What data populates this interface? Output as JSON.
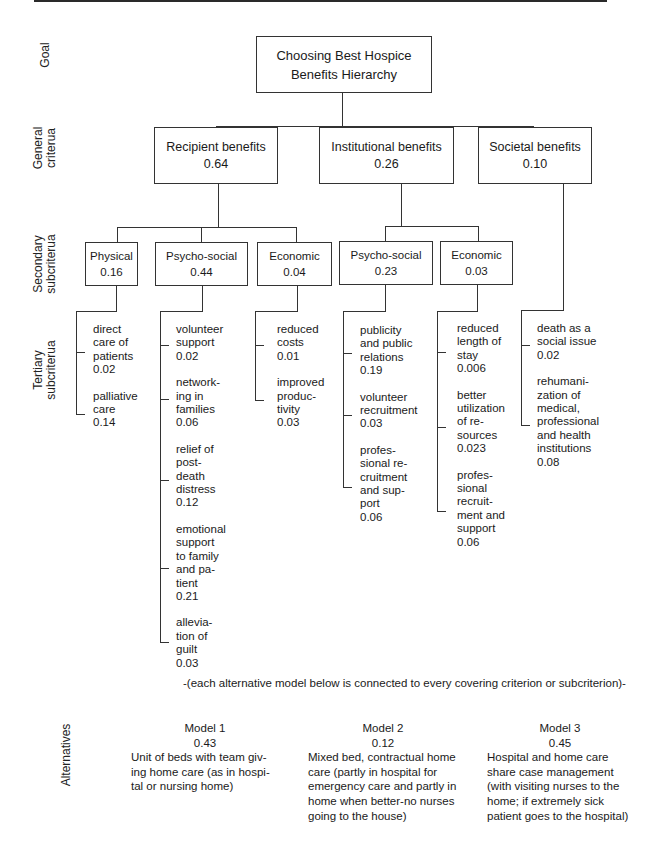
{
  "title": "Choosing Best Hospice Benefits Hierarchy",
  "level_labels": {
    "goal": "Goal",
    "general": [
      "General",
      "criterua"
    ],
    "secondary": [
      "Secondary",
      "subcriterua"
    ],
    "tertiary": [
      "Tertiary",
      "subcriterua"
    ],
    "alternatives": "Alternatives"
  },
  "goal": {
    "lines": [
      "Choosing Best Hospice",
      "Benefits Hierarchy"
    ]
  },
  "general_criteria": [
    {
      "label": "Recipient benefits",
      "weight": "0.64"
    },
    {
      "label": "Institutional benefits",
      "weight": "0.26"
    },
    {
      "label": "Societal benefits",
      "weight": "0.10"
    }
  ],
  "secondary_subcriteria": [
    {
      "parent": "Recipient benefits",
      "label": "Physical",
      "weight": "0.16"
    },
    {
      "parent": "Recipient benefits",
      "label": "Psycho-social",
      "weight": "0.44"
    },
    {
      "parent": "Recipient benefits",
      "label": "Economic",
      "weight": "0.04"
    },
    {
      "parent": "Institutional benefits",
      "label": "Psycho-social",
      "weight": "0.23"
    },
    {
      "parent": "Institutional benefits",
      "label": "Economic",
      "weight": "0.03"
    }
  ],
  "tertiary_subcriteria": [
    {
      "parent": "Physical 0.16",
      "items": [
        {
          "lines": [
            "direct",
            "care of",
            "patients"
          ],
          "weight": "0.02"
        },
        {
          "lines": [
            "palliative",
            "care"
          ],
          "weight": "0.14"
        }
      ]
    },
    {
      "parent": "Psycho-social 0.44",
      "items": [
        {
          "lines": [
            "volunteer",
            "support"
          ],
          "weight": "0.02"
        },
        {
          "lines": [
            "network-",
            "ing in",
            "families"
          ],
          "weight": "0.06"
        },
        {
          "lines": [
            "relief of",
            "post-",
            "death",
            "distress"
          ],
          "weight": "0.12"
        },
        {
          "lines": [
            "emotional",
            "support",
            "to family",
            "and pa-",
            "tient"
          ],
          "weight": "0.21"
        },
        {
          "lines": [
            "allevia-",
            "tion of",
            "guilt"
          ],
          "weight": "0.03"
        }
      ]
    },
    {
      "parent": "Economic 0.04",
      "items": [
        {
          "lines": [
            "reduced",
            "costs"
          ],
          "weight": "0.01"
        },
        {
          "lines": [
            "improved",
            "produc-",
            "tivity"
          ],
          "weight": "0.03"
        }
      ]
    },
    {
      "parent": "Psycho-social 0.23",
      "items": [
        {
          "lines": [
            "publicity",
            "and public",
            "relations"
          ],
          "weight": "0.19"
        },
        {
          "lines": [
            "volunteer",
            "recruitment"
          ],
          "weight": "0.03"
        },
        {
          "lines": [
            "profes-",
            "sional re-",
            "cruitment",
            "and sup-",
            "port"
          ],
          "weight": "0.06"
        }
      ]
    },
    {
      "parent": "Economic 0.03",
      "items": [
        {
          "lines": [
            "reduced",
            "length of",
            "stay"
          ],
          "weight": "0.006"
        },
        {
          "lines": [
            "better",
            "utilization",
            "of re-",
            "sources"
          ],
          "weight": "0.023"
        },
        {
          "lines": [
            "profes-",
            "sional",
            "recruit-",
            "ment and",
            "support"
          ],
          "weight": "0.06"
        }
      ]
    },
    {
      "parent": "Societal benefits 0.10",
      "items": [
        {
          "lines": [
            "death as a",
            "social issue"
          ],
          "weight": "0.02"
        },
        {
          "lines": [
            "rehumani-",
            "zation of",
            "medical,",
            "professional",
            "and health",
            "institutions"
          ],
          "weight": "0.08"
        }
      ]
    }
  ],
  "note": "-(each alternative model below is connected to every covering criterion or subcriterion)-",
  "alternatives": [
    {
      "title": "Model 1",
      "weight": "0.43",
      "description": "Unit of beds with team giving home care (as in hospital or nursing home)",
      "lines": [
        "Unit of beds with team giv-",
        "ing home care (as in hospi-",
        "tal or nursing home)"
      ]
    },
    {
      "title": "Model 2",
      "weight": "0.12",
      "description": "Mixed bed, contractual home care (partly in hospital for emergency care and partly in home when better-no nurses going to the house)",
      "lines": [
        "Mixed bed, contractual home",
        "care (partly in hospital for",
        "emergency care and partly in",
        "home when better-no nurses",
        "going to the house)"
      ]
    },
    {
      "title": "Model 3",
      "weight": "0.45",
      "description": "Hospital and home care share case management (with visiting nurses to the home; if extremely sick patient goes to the hospital)",
      "lines": [
        "Hospital and home care",
        "share case management",
        "(with visiting nurses to the",
        "home; if extremely sick",
        "patient goes to the hospital)"
      ]
    }
  ],
  "colors": {
    "line": "#333333",
    "text": "#1a1a1a",
    "background": "#ffffff"
  }
}
